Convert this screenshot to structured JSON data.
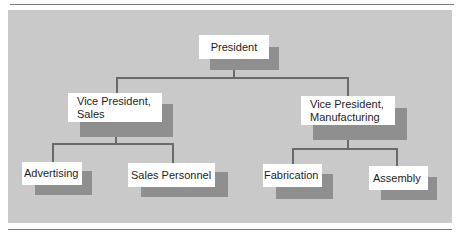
{
  "colors": {
    "panel_background": "#c9c9c9",
    "box_fill": "#ffffff",
    "box_shadow": "#8f8f8f",
    "connector_line": "#6a6a6a",
    "text": "#1e1e1e"
  },
  "org_chart": {
    "root": {
      "label": "President",
      "children": [
        {
          "label": "Vice President,\nSales",
          "children": [
            {
              "label": "Advertising"
            },
            {
              "label": "Sales Personnel"
            }
          ]
        },
        {
          "label": "Vice President,\nManufacturing",
          "children": [
            {
              "label": "Fabrication"
            },
            {
              "label": "Assembly"
            }
          ]
        }
      ]
    }
  },
  "nodes": {
    "president": "President",
    "vp_sales": "Vice President,\nSales",
    "vp_manufacturing": "Vice President,\nManufacturing",
    "advertising": "Advertising",
    "sales_personnel": "Sales Personnel",
    "fabrication": "Fabrication",
    "assembly": "Assembly"
  }
}
